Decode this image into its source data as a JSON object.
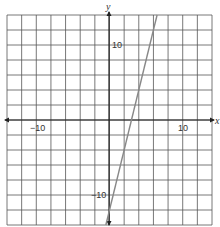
{
  "chart_data": {
    "type": "line",
    "title": "",
    "xlabel": "x",
    "ylabel": "y",
    "xlim": [
      -14,
      14
    ],
    "ylim": [
      -14,
      14
    ],
    "grid": true,
    "grid_step": 2,
    "tick_labels": {
      "x": [
        {
          "value": -10,
          "label": "−10"
        },
        {
          "value": 10,
          "label": "10"
        }
      ],
      "y": [
        {
          "value": 10,
          "label": "10"
        },
        {
          "value": -10,
          "label": "−10"
        }
      ]
    },
    "series": [
      {
        "name": "line",
        "equation": "y = 4x - 12",
        "slope": 4,
        "intercept": -12,
        "x": [
          -0.5,
          6.5
        ],
        "y": [
          -14,
          14
        ],
        "color": "#888888"
      }
    ],
    "legend": null
  },
  "labels": {
    "x_axis": "x",
    "y_axis": "y",
    "x_neg10": "−10",
    "x_pos10": "10",
    "y_pos10": "10",
    "y_neg10": "−10"
  }
}
